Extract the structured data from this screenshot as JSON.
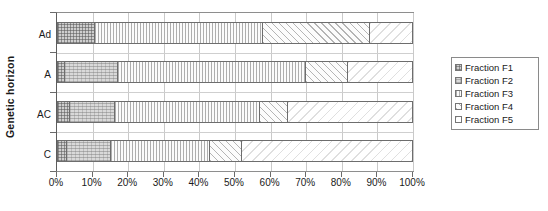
{
  "chart_data": {
    "type": "bar",
    "subtype": "stacked-horizontal-100pct",
    "title": "",
    "xlabel": "",
    "ylabel": "Genetic horizon",
    "orientation": "horizontal",
    "stacked": true,
    "grid": true,
    "legend_position": "right",
    "xlim": [
      0,
      100
    ],
    "xticks": [
      "0%",
      "10%",
      "20%",
      "30%",
      "40%",
      "50%",
      "60%",
      "70%",
      "80%",
      "90%",
      "100%"
    ],
    "xtick_values": [
      0,
      10,
      20,
      30,
      40,
      50,
      60,
      70,
      80,
      90,
      100
    ],
    "categories": [
      "Ad",
      "A",
      "AC",
      "C"
    ],
    "series": [
      {
        "name": "Fraction F1",
        "pattern": "cross-hatch-dark",
        "values": [
          10.5,
          2.0,
          3.5,
          2.5
        ]
      },
      {
        "name": "Fraction F2",
        "pattern": "dotted-gray",
        "values": [
          0.0,
          15.0,
          12.5,
          12.5
        ]
      },
      {
        "name": "Fraction F3",
        "pattern": "vertical-lines",
        "values": [
          47.5,
          53.0,
          41.0,
          28.0
        ]
      },
      {
        "name": "Fraction F4",
        "pattern": "diagonal-hatch",
        "values": [
          30.0,
          12.0,
          8.0,
          9.0
        ]
      },
      {
        "name": "Fraction F5",
        "pattern": "light-diagonal",
        "values": [
          12.0,
          18.0,
          35.0,
          48.0
        ]
      }
    ]
  },
  "legend": {
    "items": [
      {
        "label": "Fraction F1"
      },
      {
        "label": "Fraction F2"
      },
      {
        "label": "Fraction F3"
      },
      {
        "label": "Fraction F4"
      },
      {
        "label": "Fraction F5"
      }
    ]
  }
}
